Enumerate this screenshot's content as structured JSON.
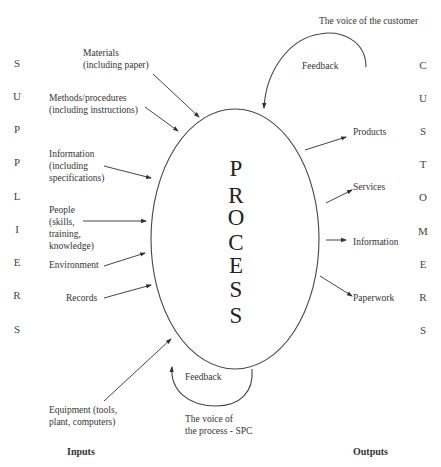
{
  "diagram": {
    "center_label": [
      "P",
      "R",
      "O",
      "C",
      "E",
      "S",
      "S"
    ],
    "suppliers_letters": [
      "S",
      "U",
      "P",
      "P",
      "L",
      "I",
      "E",
      "R",
      "S"
    ],
    "customers_letters": [
      "C",
      "U",
      "S",
      "T",
      "O",
      "M",
      "E",
      "R",
      "S"
    ],
    "inputs": [
      {
        "label": "Materials\n(including paper)"
      },
      {
        "label": "Methods/procedures\n(including instructions)"
      },
      {
        "label": "Information\n(including\nspecifications)"
      },
      {
        "label": "People\n(skills,\ntraining,\nknowledge)"
      },
      {
        "label": "Environment"
      },
      {
        "label": "Records"
      },
      {
        "label": "Equipment (tools,\nplant, computers)"
      }
    ],
    "outputs": [
      {
        "label": "Products"
      },
      {
        "label": "Services"
      },
      {
        "label": "Information"
      },
      {
        "label": "Paperwork"
      }
    ],
    "feedback_top": {
      "label": "Feedback",
      "source": "The voice of the customer"
    },
    "feedback_bottom": {
      "label": "Feedback",
      "source": "The voice of\nthe process - SPC"
    },
    "footer": {
      "inputs_label": "Inputs",
      "outputs_label": "Outputs"
    }
  }
}
